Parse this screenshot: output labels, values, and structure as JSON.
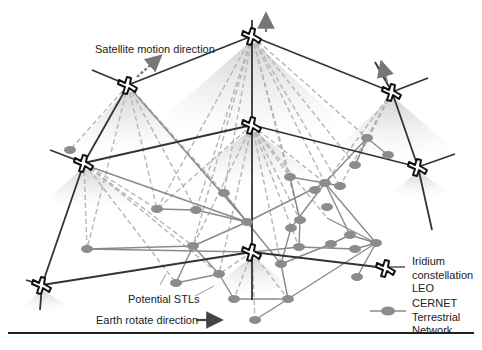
{
  "labels": {
    "satellite_motion": "Satellite motion direction",
    "potential_stls": "Potential STLs",
    "earth_rotate": "Earth rotate direction"
  },
  "legend": {
    "items": [
      {
        "icon": "satellite-icon",
        "lines": [
          "Iridium",
          "constellation",
          "LEO"
        ]
      },
      {
        "icon": "ground-node-icon",
        "lines": [
          "CERNET",
          "Terrestrial",
          "Network"
        ]
      }
    ]
  },
  "colors": {
    "satellite_link": "#333333",
    "terrestrial_link": "#8a8a8a",
    "ground_node": "#8c8c8c",
    "stl_dashed": "#b5b5b5",
    "coverage_cone": "#d9d9d9"
  },
  "satellites": [
    {
      "id": "S1",
      "x": 128,
      "y": 85
    },
    {
      "id": "S2",
      "x": 252,
      "y": 36
    },
    {
      "id": "S3",
      "x": 392,
      "y": 92
    },
    {
      "id": "S4",
      "x": 84,
      "y": 163
    },
    {
      "id": "S5",
      "x": 252,
      "y": 125
    },
    {
      "id": "S6",
      "x": 418,
      "y": 167
    },
    {
      "id": "S7",
      "x": 42,
      "y": 285
    },
    {
      "id": "S8",
      "x": 252,
      "y": 252
    }
  ],
  "ground_nodes": [
    {
      "id": "G1",
      "x": 70,
      "y": 150
    },
    {
      "id": "G2",
      "x": 157,
      "y": 209
    },
    {
      "id": "G3",
      "x": 196,
      "y": 210
    },
    {
      "id": "G4",
      "x": 224,
      "y": 193
    },
    {
      "id": "G5",
      "x": 247,
      "y": 222
    },
    {
      "id": "G6",
      "x": 87,
      "y": 249
    },
    {
      "id": "G7",
      "x": 193,
      "y": 246
    },
    {
      "id": "G8",
      "x": 219,
      "y": 274
    },
    {
      "id": "G9",
      "x": 176,
      "y": 283
    },
    {
      "id": "G10",
      "x": 234,
      "y": 299
    },
    {
      "id": "G11",
      "x": 281,
      "y": 264
    },
    {
      "id": "G12",
      "x": 290,
      "y": 177
    },
    {
      "id": "G13",
      "x": 325,
      "y": 183
    },
    {
      "id": "G14",
      "x": 340,
      "y": 186
    },
    {
      "id": "G15",
      "x": 337,
      "y": 198
    },
    {
      "id": "G16",
      "x": 327,
      "y": 218
    },
    {
      "id": "G17",
      "x": 300,
      "y": 220
    },
    {
      "id": "G18",
      "x": 291,
      "y": 228
    },
    {
      "id": "G19",
      "x": 299,
      "y": 247
    },
    {
      "id": "G20",
      "x": 331,
      "y": 244
    },
    {
      "id": "G21",
      "x": 350,
      "y": 235
    },
    {
      "id": "G22",
      "x": 355,
      "y": 249
    },
    {
      "id": "G23",
      "x": 376,
      "y": 243
    },
    {
      "id": "G24",
      "x": 357,
      "y": 277
    },
    {
      "id": "G25",
      "x": 288,
      "y": 299
    },
    {
      "id": "G26",
      "x": 255,
      "y": 320
    },
    {
      "id": "G27",
      "x": 297,
      "y": 283
    },
    {
      "id": "G28",
      "x": 367,
      "y": 138
    },
    {
      "id": "G29",
      "x": 385,
      "y": 160
    },
    {
      "id": "G30",
      "x": 355,
      "y": 165
    },
    {
      "id": "G31",
      "x": 388,
      "y": 155
    }
  ]
}
